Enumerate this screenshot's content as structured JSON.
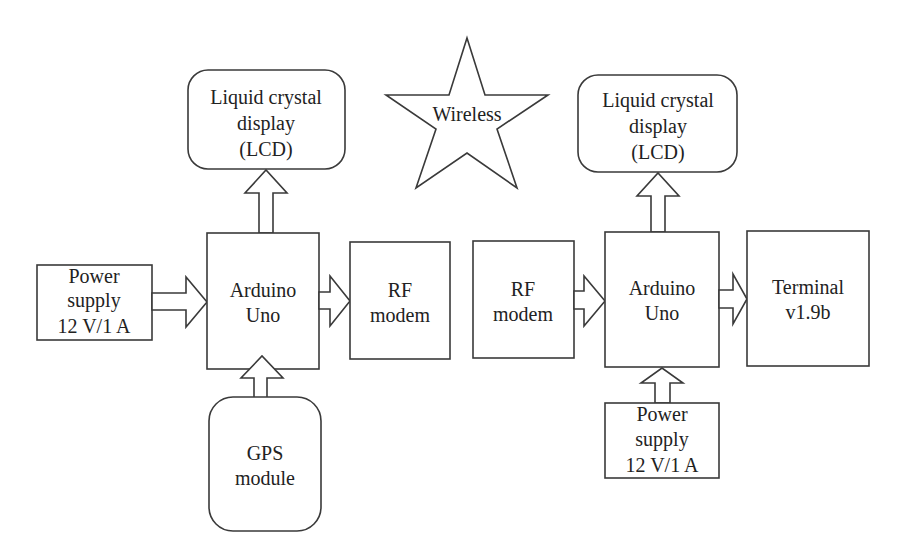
{
  "diagram": {
    "type": "block-diagram",
    "colors": {
      "stroke": "#3a3a3a",
      "text": "#222222",
      "background": "#ffffff"
    },
    "left": {
      "lcd": {
        "lines": [
          "Liquid crystal",
          "display",
          "(LCD)"
        ]
      },
      "power_supply": {
        "lines": [
          "Power",
          "supply",
          "12 V/1 A"
        ]
      },
      "arduino": {
        "lines": [
          "Arduino",
          "Uno"
        ]
      },
      "rf_modem": {
        "lines": [
          "RF",
          "modem"
        ]
      },
      "gps": {
        "lines": [
          "GPS",
          "module"
        ]
      }
    },
    "wireless": {
      "label": "Wireless"
    },
    "right": {
      "lcd": {
        "lines": [
          "Liquid crystal",
          "display",
          "(LCD)"
        ]
      },
      "rf_modem": {
        "lines": [
          "RF",
          "modem"
        ]
      },
      "arduino": {
        "lines": [
          "Arduino",
          "Uno"
        ]
      },
      "terminal": {
        "lines": [
          "Terminal",
          "v1.9b"
        ]
      },
      "power_supply": {
        "lines": [
          "Power",
          "supply",
          "12 V/1 A"
        ]
      }
    },
    "connections": [
      {
        "from": "left.power_supply",
        "to": "left.arduino"
      },
      {
        "from": "left.gps",
        "to": "left.arduino"
      },
      {
        "from": "left.arduino",
        "to": "left.lcd"
      },
      {
        "from": "left.arduino",
        "to": "left.rf_modem"
      },
      {
        "from": "right.rf_modem",
        "to": "right.arduino"
      },
      {
        "from": "right.power_supply",
        "to": "right.arduino"
      },
      {
        "from": "right.arduino",
        "to": "right.lcd"
      },
      {
        "from": "right.arduino",
        "to": "right.terminal"
      }
    ]
  }
}
